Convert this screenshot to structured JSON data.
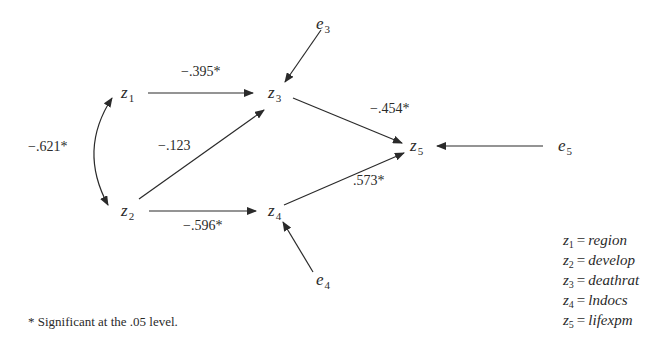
{
  "diagram": {
    "type": "path-analysis",
    "nodes": [
      {
        "id": "z1",
        "var": "z",
        "sub": "1",
        "x": 121,
        "y": 84
      },
      {
        "id": "z2",
        "var": "z",
        "sub": "2",
        "x": 121,
        "y": 202
      },
      {
        "id": "z3",
        "var": "z",
        "sub": "3",
        "x": 268,
        "y": 84
      },
      {
        "id": "z4",
        "var": "z",
        "sub": "4",
        "x": 268,
        "y": 202
      },
      {
        "id": "z5",
        "var": "z",
        "sub": "5",
        "x": 410,
        "y": 137
      },
      {
        "id": "e3",
        "var": "e",
        "sub": "3",
        "x": 316,
        "y": 15
      },
      {
        "id": "e4",
        "var": "e",
        "sub": "4",
        "x": 316,
        "y": 271
      },
      {
        "id": "e5",
        "var": "e",
        "sub": "5",
        "x": 558,
        "y": 137
      }
    ],
    "paths": [
      {
        "from": "z1",
        "to": "z3",
        "coef": "−.395*",
        "label_x": 181,
        "label_y": 65
      },
      {
        "from": "z2",
        "to": "z3",
        "coef": "−.123",
        "label_x": 158,
        "label_y": 139
      },
      {
        "from": "z2",
        "to": "z4",
        "coef": "−.596*",
        "label_x": 183,
        "label_y": 219
      },
      {
        "from": "z3",
        "to": "z5",
        "coef": "−.454*",
        "label_x": 370,
        "label_y": 102
      },
      {
        "from": "z4",
        "to": "z5",
        "coef": ".573*",
        "label_x": 353,
        "label_y": 174
      },
      {
        "from": "z1",
        "to": "z2",
        "coef": "−.621*",
        "label_x": 28,
        "label_y": 140,
        "type": "correlation"
      },
      {
        "from": "e3",
        "to": "z3",
        "coef": ""
      },
      {
        "from": "e4",
        "to": "z4",
        "coef": ""
      },
      {
        "from": "e5",
        "to": "z5",
        "coef": ""
      }
    ],
    "legend": [
      {
        "var": "z",
        "sub": "1",
        "eq": "=",
        "name": "region"
      },
      {
        "var": "z",
        "sub": "2",
        "eq": "=",
        "name": "develop"
      },
      {
        "var": "z",
        "sub": "3",
        "eq": "=",
        "name": "deathrat"
      },
      {
        "var": "z",
        "sub": "4",
        "eq": "=",
        "name": "lndocs"
      },
      {
        "var": "z",
        "sub": "5",
        "eq": "=",
        "name": "lifexpm"
      }
    ],
    "footnote": "* Significant at the .05 level.",
    "colors": {
      "line": "#2a2a2a",
      "text": "#2a2a2a",
      "background": "#ffffff"
    }
  }
}
